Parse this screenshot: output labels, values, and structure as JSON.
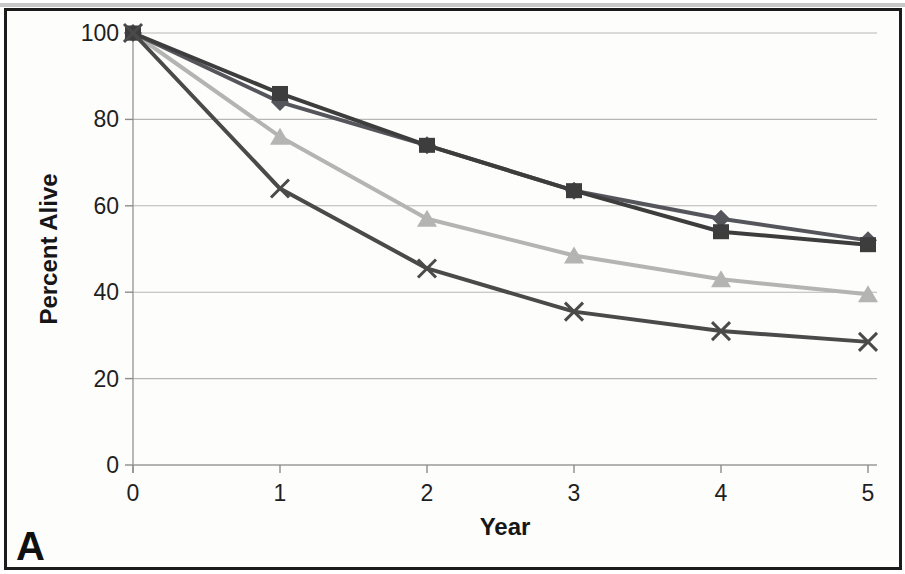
{
  "panel_label": "A",
  "chart_data": {
    "type": "line",
    "title": "",
    "xlabel": "Year",
    "ylabel": "Percent Alive",
    "x": [
      0,
      1,
      2,
      3,
      4,
      5
    ],
    "xlim": [
      0,
      5
    ],
    "ylim": [
      0,
      100
    ],
    "yticks": [
      0,
      20,
      40,
      60,
      80,
      100
    ],
    "grid": true,
    "legend": "none",
    "colors": {
      "grid": "#b7b7b5",
      "axis": "#9a9a98",
      "tick": "#8c8c8a",
      "tick_label": "#1f1f1f",
      "axis_title": "#161616"
    },
    "series": [
      {
        "name": "diamond-series",
        "marker": "diamond",
        "color": "#55555c",
        "values": [
          100,
          84,
          74,
          63.5,
          57,
          52
        ]
      },
      {
        "name": "square-series",
        "marker": "square",
        "color": "#3d3d3d",
        "values": [
          100,
          86,
          74,
          63.5,
          54,
          51
        ]
      },
      {
        "name": "triangle-series",
        "marker": "triangle",
        "color": "#b4b4b2",
        "values": [
          100,
          76,
          57,
          48.5,
          43,
          39.5
        ]
      },
      {
        "name": "x-series",
        "marker": "x",
        "color": "#4a4a4a",
        "values": [
          100,
          64,
          45.5,
          35.5,
          31,
          28.5
        ]
      }
    ]
  }
}
